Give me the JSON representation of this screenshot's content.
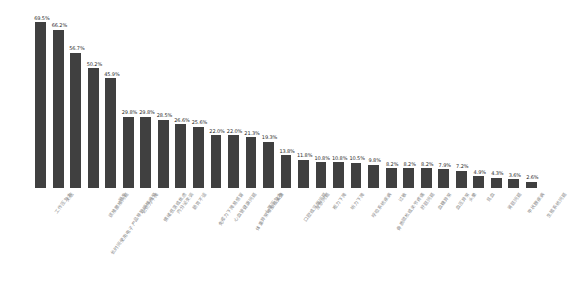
{
  "chart_data": {
    "type": "bar",
    "title": "",
    "subtitle": "",
    "xlabel": "",
    "ylabel": "",
    "ylim": [
      0,
      75
    ],
    "grid": false,
    "legend": null,
    "value_suffix": "%",
    "bar_color": "#404040",
    "label_color": "#2b2b2b",
    "category_label_color": "#8a8a8a",
    "categories": [
      "工作压力大",
      "失眠",
      "长时间使用电子产品导致眼睛疲劳",
      "颈椎腰椎问题",
      "脱发",
      "记忆力下降",
      "情绪低落或焦虑",
      "内分泌失调",
      "肠胃不适",
      "免疫力下降易感冒",
      "心血管健康问题",
      "体重异常增加或减少",
      "心理压力大",
      "头痛",
      "口腔或牙龈问题",
      "皮肤问题",
      "视力下降",
      "听力下降",
      "呼吸系统疾病",
      "骨质疏松或关节疼痛",
      "过敏",
      "肝脏问题",
      "血糖异常",
      "血压异常",
      "头晕",
      "贫血",
      "肾脏问题",
      "甲状腺疾病",
      "生殖系统问题",
      "其他",
      "近两年内曾被医生诊断出慢性疾病"
    ],
    "values": [
      69.5,
      66.2,
      56.7,
      50.2,
      45.9,
      29.8,
      29.8,
      28.5,
      26.6,
      25.6,
      22.0,
      22.0,
      21.3,
      19.3,
      13.8,
      11.8,
      10.8,
      10.8,
      10.5,
      9.8,
      8.2,
      8.2,
      8.2,
      7.9,
      7.2,
      4.9,
      4.3,
      3.6,
      2.6,
      0,
      0
    ],
    "value_labels": [
      "69.5%",
      "66.2%",
      "56.7%",
      "50.2%",
      "45.9%",
      "29.8%",
      "29.8%",
      "28.5%",
      "26.6%",
      "25.6%",
      "22.0%",
      "22.0%",
      "21.3%",
      "19.3%",
      "13.8%",
      "11.8%",
      "10.8%",
      "10.8%",
      "10.5%",
      "9.8%",
      "8.2%",
      "8.2%",
      "8.2%",
      "7.9%",
      "7.2%",
      "4.9%",
      "4.3%",
      "3.6%",
      "2.6%",
      "",
      ""
    ],
    "bar_count": 29
  }
}
